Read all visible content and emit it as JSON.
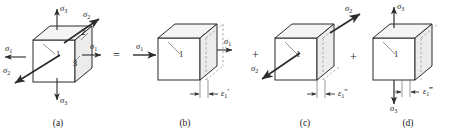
{
  "figure": {
    "stroke_color": "#2b2b2b",
    "face_color": "#ffffff",
    "shade_color": "#e8e8e8"
  },
  "operators": {
    "equals": "=",
    "plus_1": "+",
    "plus_2": "+"
  },
  "panels": [
    {
      "id": "a",
      "caption": "(a)",
      "face_numbers": [
        "1",
        "2",
        "3"
      ],
      "stress_labels": [
        {
          "name": "sigma-3-top",
          "sym": "σ",
          "sub": "3",
          "prime": ""
        },
        {
          "name": "sigma-2-upper-right",
          "sym": "σ",
          "sub": "2",
          "prime": ""
        },
        {
          "name": "sigma-1-left",
          "sym": "σ",
          "sub": "1",
          "prime": ""
        },
        {
          "name": "sigma-1-right",
          "sym": "σ",
          "sub": "1",
          "prime": ""
        },
        {
          "name": "sigma-2-lower-left",
          "sym": "σ",
          "sub": "2",
          "prime": ""
        },
        {
          "name": "sigma-3-bottom",
          "sym": "σ",
          "sub": "3",
          "prime": ""
        }
      ],
      "strain_label": null
    },
    {
      "id": "b",
      "caption": "(b)",
      "face_numbers": [
        "1"
      ],
      "stress_labels": [
        {
          "name": "sigma-1-left",
          "sym": "σ",
          "sub": "1",
          "prime": ""
        },
        {
          "name": "sigma-1-right",
          "sym": "σ",
          "sub": "1",
          "prime": ""
        }
      ],
      "strain_label": {
        "name": "epsilon-1-prime",
        "sym": "ε",
        "sub": "1",
        "prime": "′"
      }
    },
    {
      "id": "c",
      "caption": "(c)",
      "face_numbers": [
        "1"
      ],
      "stress_labels": [
        {
          "name": "sigma-2-upper-right",
          "sym": "σ",
          "sub": "2",
          "prime": ""
        },
        {
          "name": "sigma-2-lower-left",
          "sym": "σ",
          "sub": "2",
          "prime": ""
        }
      ],
      "strain_label": {
        "name": "epsilon-1-double-prime",
        "sym": "ε",
        "sub": "1",
        "prime": "″"
      }
    },
    {
      "id": "d",
      "caption": "(d)",
      "face_numbers": [
        "1"
      ],
      "stress_labels": [
        {
          "name": "sigma-3-top",
          "sym": "σ",
          "sub": "3",
          "prime": ""
        },
        {
          "name": "sigma-3-bottom",
          "sym": "σ",
          "sub": "3",
          "prime": ""
        }
      ],
      "strain_label": {
        "name": "epsilon-1-triple-prime",
        "sym": "ε",
        "sub": "1",
        "prime": "‴"
      }
    }
  ]
}
